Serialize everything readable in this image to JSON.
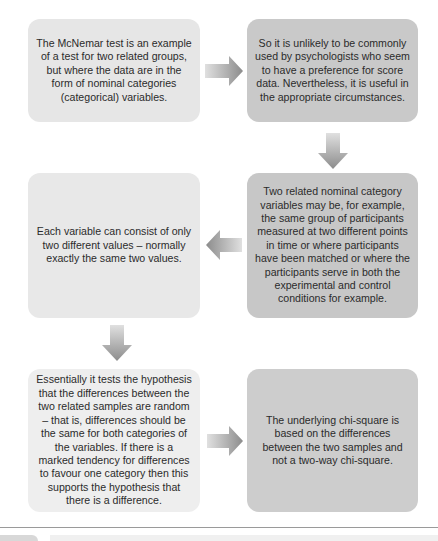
{
  "flowchart": {
    "boxes": [
      {
        "id": "box1",
        "text": "The McNemar test is an example of a test for two related groups, but where the data are in the form of nominal categories (categorical) variables.",
        "fill": "#e6e6e6"
      },
      {
        "id": "box2",
        "text": "So it is unlikely to be commonly used by psychologists who seem to have a preference for score data. Nevertheless, it is useful in the appropriate circumstances.",
        "fill": "#c9c9c9"
      },
      {
        "id": "box3",
        "text": "Each variable can consist of only two different values – normally exactly the same two values.",
        "fill": "#e8e8e8"
      },
      {
        "id": "box4",
        "text": "Two related nominal category variables may be, for example, the same group of participants measured at two different points in time or where participants have been matched or where the participants serve in both the experimental and control conditions for example.",
        "fill": "#c7c7c7"
      },
      {
        "id": "box5",
        "text": "Essentially it tests the hypothesis that the differences between the two related samples are random – that is, differences should be the same for both categories of the variables. If there is a marked tendency for differences to favour one category then this supports the hypothesis that there is a difference.",
        "fill": "#eeeeee"
      },
      {
        "id": "box6",
        "text": "The underlying chi-square is based on the differences between the two samples and not a two-way chi-square.",
        "fill": "#cdcdcd"
      }
    ],
    "arrows": [
      {
        "from": "box1",
        "to": "box2",
        "direction": "right"
      },
      {
        "from": "box2",
        "to": "box4",
        "direction": "down"
      },
      {
        "from": "box4",
        "to": "box3",
        "direction": "left"
      },
      {
        "from": "box3",
        "to": "box5",
        "direction": "down"
      },
      {
        "from": "box5",
        "to": "box6",
        "direction": "right"
      }
    ],
    "arrow_color": "#8c8c8c"
  }
}
